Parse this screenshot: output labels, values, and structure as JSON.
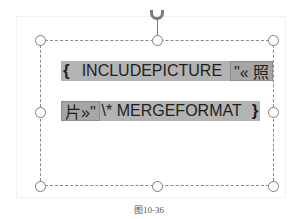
{
  "field_code": {
    "line1": {
      "open_brace": "{",
      "keyword": "INCLUDEPICTURE",
      "arg_start": "\"« 照"
    },
    "line2": {
      "arg_end": "片»\"",
      "switch": "\\* MERGEFORMAT",
      "close_brace": "}"
    }
  },
  "caption": "图10-36",
  "icons": {
    "rotate": "rotate-handle-icon",
    "resize": "resize-handle-icon"
  },
  "colors": {
    "field_shading": "#b3b3b3",
    "selected_shading": "#a6a6a6",
    "frame_border": "#8a8a8a"
  }
}
